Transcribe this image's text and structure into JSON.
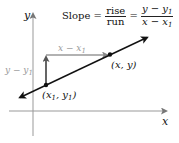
{
  "diagram": {
    "axes": {
      "x_label": "x",
      "y_label": "y"
    },
    "formula": {
      "lhs": "Slope",
      "equals": "=",
      "frac1_num": "rise",
      "frac1_den": "run",
      "frac2_num": "y − y",
      "frac2_num_sub": "1",
      "frac2_den": "x − x",
      "frac2_den_sub": "1"
    },
    "points": [
      {
        "label": "(x",
        "sub": "1",
        "label2": ", y",
        "sub2": "1",
        "label3": ")"
      },
      {
        "label": "(x, y)"
      }
    ],
    "rise_label": "y − y",
    "rise_label_sub": "1",
    "run_label": "x − x",
    "run_label_sub": "1",
    "colors": {
      "line": "#111111",
      "axes": "#888888",
      "rise_run": "#9a9a9a",
      "rise_arrow": "#555555"
    }
  }
}
